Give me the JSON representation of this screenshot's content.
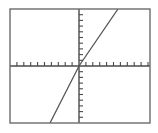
{
  "graph": {
    "title": "",
    "frame": {
      "x": 10,
      "y": 9,
      "width": 140,
      "height": 114,
      "border_color": "#6b6b6b",
      "border_width": 1.4,
      "background": "#ffffff"
    },
    "axes": {
      "color": "#4a4a4a",
      "width": 1.4,
      "origin_x": 79,
      "origin_y": 66,
      "tick_length": 4,
      "tick_width": 1.1,
      "x_tick_spacing": 6.9,
      "y_tick_spacing": 5.7,
      "x_ticks_left": 10,
      "x_ticks_right": 10,
      "y_ticks_up": 10,
      "y_ticks_down": 10,
      "x_label": "",
      "y_label": ""
    },
    "curve": {
      "color": "#565656",
      "width": 1.3,
      "label": ""
    }
  },
  "chart_data": {
    "type": "line",
    "title": "",
    "subtitle": "",
    "xlabel": "",
    "ylabel": "",
    "grid": false,
    "legend": null,
    "xlim": [
      -10,
      10
    ],
    "ylim": [
      -10,
      10
    ],
    "x_tick_step": 1,
    "y_tick_step": 1,
    "x_tick_labels": [],
    "y_tick_labels": [],
    "annotations": [],
    "series": [
      {
        "name": "line",
        "equation": "y = 2.1x",
        "slope": 2.1,
        "intercept": 0,
        "x": [
          -4.5,
          0,
          5.5
        ],
        "y": [
          -9.45,
          0,
          11.55
        ],
        "points_px": [
          {
            "x": 50,
            "y": 123
          },
          {
            "x": 79,
            "y": 66
          },
          {
            "x": 118,
            "y": 9
          }
        ]
      }
    ]
  }
}
